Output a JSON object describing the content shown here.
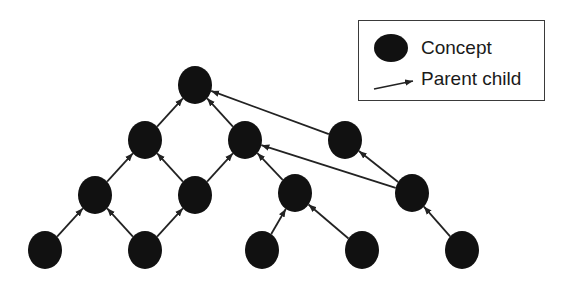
{
  "legend": {
    "concept_label": "Concept",
    "edge_label": "Parent child"
  },
  "colors": {
    "node": "#111111",
    "edge": "#222222",
    "background": "#ffffff"
  },
  "nodes": [
    {
      "id": "n0",
      "x": 195,
      "y": 85
    },
    {
      "id": "n1",
      "x": 145,
      "y": 140
    },
    {
      "id": "n2",
      "x": 245,
      "y": 140
    },
    {
      "id": "n3",
      "x": 345,
      "y": 140
    },
    {
      "id": "n4",
      "x": 95,
      "y": 195
    },
    {
      "id": "n5",
      "x": 195,
      "y": 195
    },
    {
      "id": "n6",
      "x": 295,
      "y": 193
    },
    {
      "id": "n7",
      "x": 412,
      "y": 193
    },
    {
      "id": "n8",
      "x": 45,
      "y": 250
    },
    {
      "id": "n9",
      "x": 145,
      "y": 250
    },
    {
      "id": "n10",
      "x": 262,
      "y": 250
    },
    {
      "id": "n11",
      "x": 362,
      "y": 250
    },
    {
      "id": "n12",
      "x": 462,
      "y": 250
    }
  ],
  "edges": [
    {
      "from": "n1",
      "to": "n0"
    },
    {
      "from": "n2",
      "to": "n0"
    },
    {
      "from": "n3",
      "to": "n0"
    },
    {
      "from": "n4",
      "to": "n1"
    },
    {
      "from": "n5",
      "to": "n1"
    },
    {
      "from": "n5",
      "to": "n2"
    },
    {
      "from": "n6",
      "to": "n2"
    },
    {
      "from": "n7",
      "to": "n2"
    },
    {
      "from": "n7",
      "to": "n3"
    },
    {
      "from": "n8",
      "to": "n4"
    },
    {
      "from": "n9",
      "to": "n4"
    },
    {
      "from": "n9",
      "to": "n5"
    },
    {
      "from": "n10",
      "to": "n6"
    },
    {
      "from": "n11",
      "to": "n6"
    },
    {
      "from": "n12",
      "to": "n7"
    }
  ]
}
